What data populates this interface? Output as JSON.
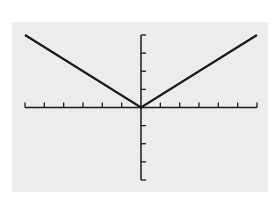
{
  "chart_data": {
    "type": "line",
    "title": "",
    "xlabel": "",
    "ylabel": "",
    "xlim": [
      -6,
      6
    ],
    "ylim": [
      -4,
      4
    ],
    "x_tick_step": 1,
    "y_tick_step": 1,
    "grid": false,
    "series": [
      {
        "name": "y = (2/3)|x|",
        "x": [
          -6,
          0,
          6
        ],
        "y": [
          4,
          0,
          4
        ]
      }
    ],
    "colors": {
      "background": "#ececec",
      "line": "#1a1a1a",
      "axes": "#1a1a1a"
    }
  }
}
